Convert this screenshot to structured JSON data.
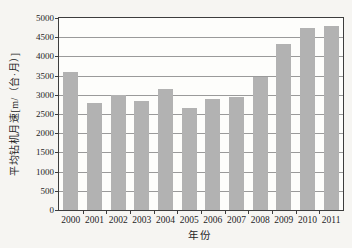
{
  "figure": {
    "background_color": "#f6f5f2",
    "plot_background_color": "#fdfdfb",
    "bar_color": "#b2b2b2",
    "gridline_color": "#9a9a9a",
    "axis_color": "#3d3d3d",
    "text_color": "#1f1f1f"
  },
  "chart_data": {
    "type": "bar",
    "title": "",
    "xlabel": "年份",
    "ylabel": "平均钻机月速[m/（台·月）]",
    "categories": [
      "2000",
      "2001",
      "2002",
      "2003",
      "2004",
      "2005",
      "2006",
      "2007",
      "2008",
      "2009",
      "2010",
      "2011"
    ],
    "values": [
      3600,
      2780,
      3000,
      2840,
      3150,
      2650,
      2890,
      2950,
      3470,
      4320,
      4740,
      4800
    ],
    "ylim": [
      0,
      5000
    ],
    "ytick_step": 500,
    "ytick_labels": [
      "0",
      "500",
      "1000",
      "1500",
      "2000",
      "2500",
      "3000",
      "3500",
      "4000",
      "4500",
      "5000"
    ],
    "grid": "horizontal",
    "legend_position": "none"
  }
}
